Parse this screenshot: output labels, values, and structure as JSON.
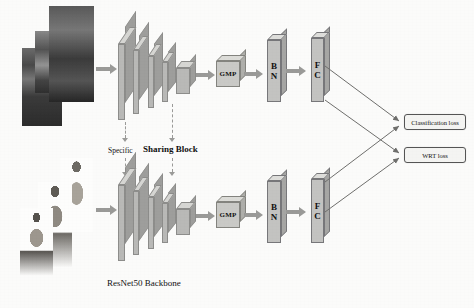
{
  "figure": {
    "background_color": "#fbfbfa"
  },
  "labels": {
    "specific": "Specific",
    "sharing_block": "Sharing Block",
    "backbone": "ResNet50 Backbone"
  },
  "branches": {
    "top": {
      "name": "photo-branch",
      "input_type": "photo",
      "gmp": "GMP",
      "bn": "BN",
      "bn_line1": "B",
      "bn_line2": "N",
      "fc": "FC",
      "fc_line1": "F",
      "fc_line2": "C"
    },
    "bottom": {
      "name": "sketch-branch",
      "input_type": "sketch",
      "gmp": "GMP",
      "bn": "BN",
      "bn_line1": "B",
      "bn_line2": "N",
      "fc": "FC",
      "fc_line1": "F",
      "fc_line2": "C"
    }
  },
  "losses": [
    {
      "id": "classification",
      "label": "Classification loss"
    },
    {
      "id": "wrt",
      "label": "WRT loss"
    }
  ],
  "colors": {
    "slab_face": "#b9b9b7",
    "slab_top": "#d6d6d3",
    "slab_side": "#9e9e9c",
    "bar_face": "#c3c3c1",
    "arrow": "#9a9a98",
    "line": "#6f6f6d",
    "loss_border": "#555555"
  }
}
